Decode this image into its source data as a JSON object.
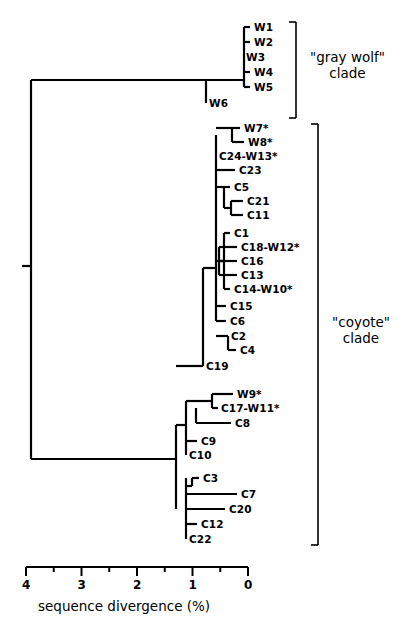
{
  "figure": {
    "type": "phylogenetic-tree",
    "orientation": "right-to-left",
    "root_x_percent": 4.0
  },
  "axis": {
    "title": "sequence divergence (%)",
    "major_ticks": [
      "4",
      "3",
      "2",
      "1",
      "0"
    ],
    "major_values": [
      4,
      3,
      2,
      1,
      0
    ],
    "minor_values": [
      3.5,
      2.5,
      1.5,
      0.5
    ],
    "range": [
      4,
      0
    ],
    "px_at_4": 26,
    "px_at_0": 248
  },
  "clades": [
    {
      "name": "gray wolf",
      "label": "\"gray wolf\"\nclade",
      "bracket_x": 296,
      "bracket_top": 22,
      "bracket_bottom": 118,
      "label_x": 310,
      "label_y": 50
    },
    {
      "name": "coyote",
      "label": "\"coyote\"\nclade",
      "bracket_x": 318,
      "bracket_top": 124,
      "bracket_bottom": 545,
      "label_x": 332,
      "label_y": 315
    }
  ],
  "tips": [
    {
      "id": "W1",
      "label": "W1",
      "y": 27,
      "branch_x": 244,
      "tip_x": 250,
      "label_x": 254,
      "clade": "gray wolf"
    },
    {
      "id": "W2",
      "label": "W2",
      "y": 42,
      "branch_x": 244,
      "tip_x": 250,
      "label_x": 254,
      "clade": "gray wolf"
    },
    {
      "id": "W3",
      "label": "W3",
      "y": 57,
      "branch_x": 244,
      "tip_x": 244,
      "label_x": 246,
      "clade": "gray wolf"
    },
    {
      "id": "W4",
      "label": "W4",
      "y": 72,
      "branch_x": 244,
      "tip_x": 250,
      "label_x": 254,
      "clade": "gray wolf"
    },
    {
      "id": "W5",
      "label": "W5",
      "y": 87,
      "branch_x": 244,
      "tip_x": 250,
      "label_x": 254,
      "clade": "gray wolf"
    },
    {
      "id": "W6",
      "label": "W6",
      "y": 103,
      "branch_x": 206,
      "tip_x": 206,
      "label_x": 209,
      "clade": "gray wolf"
    },
    {
      "id": "W7",
      "label": "W7*",
      "y": 128,
      "branch_x": 232,
      "tip_x": 240,
      "label_x": 244,
      "clade": "coyote"
    },
    {
      "id": "W8",
      "label": "W8*",
      "y": 142,
      "branch_x": 232,
      "tip_x": 244,
      "label_x": 248,
      "clade": "coyote"
    },
    {
      "id": "C24-W13",
      "label": "C24-W13*",
      "y": 156,
      "branch_x": 216,
      "tip_x": 216,
      "label_x": 219,
      "clade": "coyote"
    },
    {
      "id": "C23",
      "label": "C23",
      "y": 170,
      "branch_x": 216,
      "tip_x": 235,
      "label_x": 239,
      "clade": "coyote"
    },
    {
      "id": "C5",
      "label": "C5",
      "y": 187,
      "branch_x": 224,
      "tip_x": 230,
      "label_x": 234,
      "clade": "coyote"
    },
    {
      "id": "C21",
      "label": "C21",
      "y": 201,
      "branch_x": 231,
      "tip_x": 243,
      "label_x": 247,
      "clade": "coyote"
    },
    {
      "id": "C11",
      "label": "C11",
      "y": 215,
      "branch_x": 231,
      "tip_x": 243,
      "label_x": 247,
      "clade": "coyote"
    },
    {
      "id": "C1",
      "label": "C1",
      "y": 233,
      "branch_x": 224,
      "tip_x": 230,
      "label_x": 234,
      "clade": "coyote"
    },
    {
      "id": "C18-W12",
      "label": "C18-W12*",
      "y": 247,
      "branch_x": 219,
      "tip_x": 237,
      "label_x": 241,
      "clade": "coyote"
    },
    {
      "id": "C16",
      "label": "C16",
      "y": 261,
      "branch_x": 219,
      "tip_x": 237,
      "label_x": 241,
      "clade": "coyote"
    },
    {
      "id": "C13",
      "label": "C13",
      "y": 275,
      "branch_x": 219,
      "tip_x": 237,
      "label_x": 241,
      "clade": "coyote"
    },
    {
      "id": "C14-W10",
      "label": "C14-W10*",
      "y": 289,
      "branch_x": 224,
      "tip_x": 230,
      "label_x": 234,
      "clade": "coyote"
    },
    {
      "id": "C15",
      "label": "C15",
      "y": 306,
      "branch_x": 216,
      "tip_x": 226,
      "label_x": 230,
      "clade": "coyote"
    },
    {
      "id": "C6",
      "label": "C6",
      "y": 321,
      "branch_x": 216,
      "tip_x": 226,
      "label_x": 230,
      "clade": "coyote"
    },
    {
      "id": "C2",
      "label": "C2",
      "y": 336,
      "branch_x": 228,
      "tip_x": 228,
      "label_x": 231,
      "clade": "coyote"
    },
    {
      "id": "C4",
      "label": "C4",
      "y": 350,
      "branch_x": 228,
      "tip_x": 236,
      "label_x": 240,
      "clade": "coyote"
    },
    {
      "id": "C19",
      "label": "C19",
      "y": 366,
      "branch_x": 203,
      "tip_x": 203,
      "label_x": 206,
      "clade": "coyote"
    },
    {
      "id": "W9",
      "label": "W9*",
      "y": 394,
      "branch_x": 212,
      "tip_x": 233,
      "label_x": 237,
      "clade": "coyote"
    },
    {
      "id": "C17-W11",
      "label": "C17-W11*",
      "y": 408,
      "branch_x": 212,
      "tip_x": 218,
      "label_x": 221,
      "clade": "coyote"
    },
    {
      "id": "C8",
      "label": "C8",
      "y": 423,
      "branch_x": 196,
      "tip_x": 231,
      "label_x": 235,
      "clade": "coyote"
    },
    {
      "id": "C9",
      "label": "C9",
      "y": 441,
      "branch_x": 186,
      "tip_x": 197,
      "label_x": 201,
      "clade": "coyote"
    },
    {
      "id": "C10",
      "label": "C10",
      "y": 455,
      "branch_x": 186,
      "tip_x": 186,
      "label_x": 189,
      "clade": "coyote"
    },
    {
      "id": "C3",
      "label": "C3",
      "y": 478,
      "branch_x": 192,
      "tip_x": 199,
      "label_x": 203,
      "clade": "coyote"
    },
    {
      "id": "C7",
      "label": "C7",
      "y": 494,
      "branch_x": 186,
      "tip_x": 237,
      "label_x": 241,
      "clade": "coyote"
    },
    {
      "id": "C20",
      "label": "C20",
      "y": 509,
      "branch_x": 186,
      "tip_x": 225,
      "label_x": 229,
      "clade": "coyote"
    },
    {
      "id": "C12",
      "label": "C12",
      "y": 524,
      "branch_x": 186,
      "tip_x": 197,
      "label_x": 201,
      "clade": "coyote"
    },
    {
      "id": "C22",
      "label": "C22",
      "y": 539,
      "branch_x": 186,
      "tip_x": 186,
      "label_x": 189,
      "clade": "coyote"
    }
  ],
  "nodes": [
    {
      "id": "root",
      "x": 31,
      "y_top": 80,
      "y_bot": 459
    },
    {
      "id": "wolf-stem",
      "x": 206,
      "y_top": 80,
      "y_bot": 103
    },
    {
      "id": "wolf-crown",
      "x": 244,
      "y_top": 27,
      "y_bot": 87
    },
    {
      "id": "coy-spine",
      "x": 216,
      "y_top": 135,
      "y_bot": 321
    },
    {
      "id": "w7w8",
      "x": 232,
      "y_top": 128,
      "y_bot": 142
    },
    {
      "id": "c5grp",
      "x": 224,
      "y_top": 187,
      "y_bot": 208
    },
    {
      "id": "c21c11",
      "x": 231,
      "y_top": 201,
      "y_bot": 215
    },
    {
      "id": "c1grp",
      "x": 224,
      "y_top": 233,
      "y_bot": 289
    },
    {
      "id": "c1inner",
      "x": 219,
      "y_top": 247,
      "y_bot": 275
    },
    {
      "id": "c2c4",
      "x": 228,
      "y_top": 336,
      "y_bot": 350
    },
    {
      "id": "c19node",
      "x": 203,
      "y_top": 268,
      "y_bot": 366
    },
    {
      "id": "lowerspine",
      "x": 186,
      "y_top": 401,
      "y_bot": 455
    },
    {
      "id": "c8node",
      "x": 196,
      "y_top": 408,
      "y_bot": 423
    },
    {
      "id": "w9node",
      "x": 212,
      "y_top": 394,
      "y_bot": 408
    },
    {
      "id": "bottomclade",
      "x": 186,
      "y_top": 478,
      "y_bot": 539
    },
    {
      "id": "c3node",
      "x": 192,
      "y_top": 478,
      "y_bot": 486
    },
    {
      "id": "deepnode",
      "x": 176,
      "y_top": 425,
      "y_bot": 509
    }
  ],
  "root_tick": {
    "x_left": 22,
    "x_right": 31,
    "y": 266
  }
}
